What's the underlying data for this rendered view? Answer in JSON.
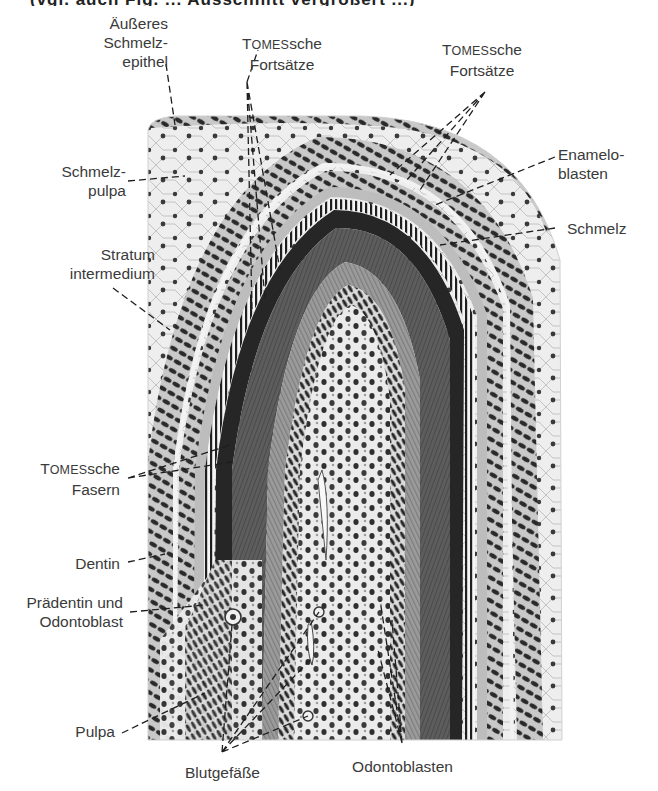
{
  "figure": {
    "top_cropped_text": "(vgl. auch Fig. ... Ausschnitt vergrößert ...)",
    "colors": {
      "background": "#ffffff",
      "label_text": "#3a3a3a",
      "leader_line": "#1e1e1e",
      "enamel": "#2e2e2e",
      "dentin": "#5a5a5a",
      "predentin": "#8a8a8a",
      "pulp": "#e8e8e8",
      "nuclei": "#303030",
      "stellate_reticulum": "#ececec"
    }
  },
  "labels": {
    "aeusseres_schmelzepithel": {
      "line1": "Äußeres",
      "line2": "Schmelz-",
      "line3": "epithel"
    },
    "tomes_fortsaetze_left": {
      "line1_cap": "T",
      "line1_sc": "OMES",
      "line1_rest": "sche",
      "line2": "Fortsätze"
    },
    "tomes_fortsaetze_right": {
      "line1_cap": "T",
      "line1_sc": "OMES",
      "line1_rest": "sche",
      "line2": "Fortsätze"
    },
    "schmelzpulpa": {
      "line1": "Schmelz-",
      "line2": "pulpa"
    },
    "enameloblasten": {
      "line1": "Enamelo-",
      "line2": "blasten"
    },
    "schmelz": {
      "line1": "Schmelz"
    },
    "stratum_intermedium": {
      "line1": "Stratum",
      "line2": "intermedium"
    },
    "tomes_fasern": {
      "line1_cap": "T",
      "line1_sc": "OMES",
      "line1_rest": "sche",
      "line2": "Fasern"
    },
    "dentin": {
      "line1": "Dentin"
    },
    "praedentin_odontoblast": {
      "line1": "Prädentin und",
      "line2": "Odontoblast"
    },
    "pulpa": {
      "line1": "Pulpa"
    },
    "blutgefaesse": {
      "line1": "Blutgefäße"
    },
    "odontoblasten": {
      "line1": "Odontoblasten"
    }
  }
}
